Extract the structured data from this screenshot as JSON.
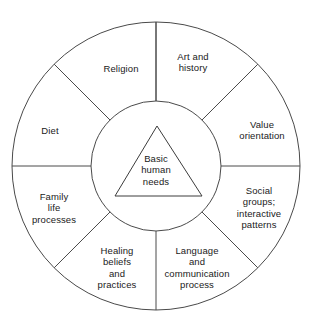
{
  "diagram": {
    "type": "concentric-wheel",
    "core": {
      "shape": "triangle",
      "label": "Basic\nhuman\nneeds"
    },
    "sectors": [
      {
        "id": "art-and-history",
        "label": "Art and\nhistory",
        "start_deg": -90,
        "end_deg": -45,
        "label_x": 193,
        "label_y": 62
      },
      {
        "id": "value-orientation",
        "label": "Value\norientation",
        "start_deg": -45,
        "end_deg": 0,
        "label_x": 262,
        "label_y": 130
      },
      {
        "id": "social-groups",
        "label": "Social\ngroups;\ninteractive\npatterns",
        "start_deg": 0,
        "end_deg": 45,
        "label_x": 259,
        "label_y": 208
      },
      {
        "id": "language-communication",
        "label": "Language\nand\ncommunication\nprocess",
        "label_x": 197,
        "label_y": 268,
        "start_deg": 45,
        "end_deg": 90
      },
      {
        "id": "healing-beliefs",
        "label": "Healing\nbeliefs\nand\npractices",
        "start_deg": 90,
        "end_deg": 135,
        "label_x": 117,
        "label_y": 268
      },
      {
        "id": "family-life-processes",
        "label": "Family\nlife\nprocesses",
        "start_deg": 135,
        "end_deg": 180,
        "label_x": 54,
        "label_y": 208
      },
      {
        "id": "diet",
        "label": "Diet",
        "start_deg": 180,
        "end_deg": 225,
        "label_x": 50,
        "label_y": 131
      },
      {
        "id": "religion",
        "label": "Religion",
        "start_deg": 225,
        "end_deg": 270,
        "label_x": 121,
        "label_y": 69
      }
    ],
    "geometry": {
      "center_x": 156,
      "center_y": 166,
      "outer_radius": 144,
      "inner_radius": 65,
      "triangle_apex_x": 157,
      "triangle_apex_y": 126,
      "triangle_left_x": 115,
      "triangle_left_y": 196,
      "triangle_right_x": 202,
      "triangle_right_y": 196
    },
    "colors": {
      "stroke": "#4a4a4a",
      "text": "#1a1a1a",
      "background": "#ffffff"
    }
  }
}
